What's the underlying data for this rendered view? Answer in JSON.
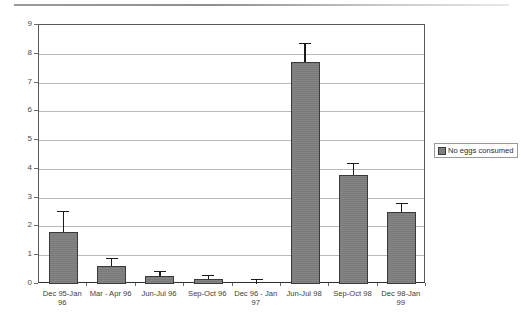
{
  "chart_data": {
    "type": "bar",
    "title": "",
    "subtitle": "",
    "xlabel": "",
    "ylabel": "",
    "ylim": [
      0,
      9
    ],
    "ytick_values": [
      0,
      1,
      2,
      3,
      4,
      5,
      6,
      7,
      8,
      9
    ],
    "ytick_labels": [
      "0",
      "1",
      "2",
      "3",
      "4",
      "5",
      "6",
      "7",
      "8",
      "9"
    ],
    "grid": true,
    "grid_axis": "y",
    "legend": {
      "position": "right",
      "entries": [
        {
          "label": "No eggs consumed",
          "color": "#7e7e7e"
        }
      ]
    },
    "categories": [
      "Dec 95-Jan 96",
      "Mar - Apr 96",
      "Jun-Jul 96",
      "Sep-Oct 96",
      "Dec 96 - Jan\n97",
      "Jun-Jul 98",
      "Sep-Oct 98",
      "Dec 98-Jan 99"
    ],
    "series": [
      {
        "name": "No eggs consumed",
        "color": "#7e7e7e",
        "values": [
          1.8,
          0.62,
          0.27,
          0.18,
          0.0,
          7.7,
          3.78,
          2.5
        ],
        "errors_upper": [
          0.75,
          0.28,
          0.18,
          0.15,
          0.17,
          0.68,
          0.42,
          0.32
        ]
      }
    ]
  },
  "legend": {
    "entry_label": "No eggs consumed"
  }
}
